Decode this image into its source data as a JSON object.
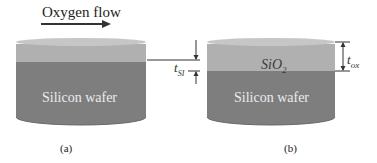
{
  "figure": {
    "flow_label": "Oxygen flow",
    "panel_a": {
      "caption": "(a)",
      "wafer_label": "Silicon wafer",
      "thickness_label": "t",
      "thickness_subscript": "SI"
    },
    "panel_b": {
      "caption": "(b)",
      "wafer_label": "Silicon wafer",
      "oxide_label": "SiO",
      "oxide_subscript": "2",
      "thickness_label": "t",
      "thickness_subscript": "ox"
    },
    "colors": {
      "top_layer": "#b4b4b4",
      "top_ellipse": "#c8c8c8",
      "silicon_body": "#7e7e7e",
      "silicon_bottom": "#6e6e6e",
      "line": "#333333"
    }
  }
}
